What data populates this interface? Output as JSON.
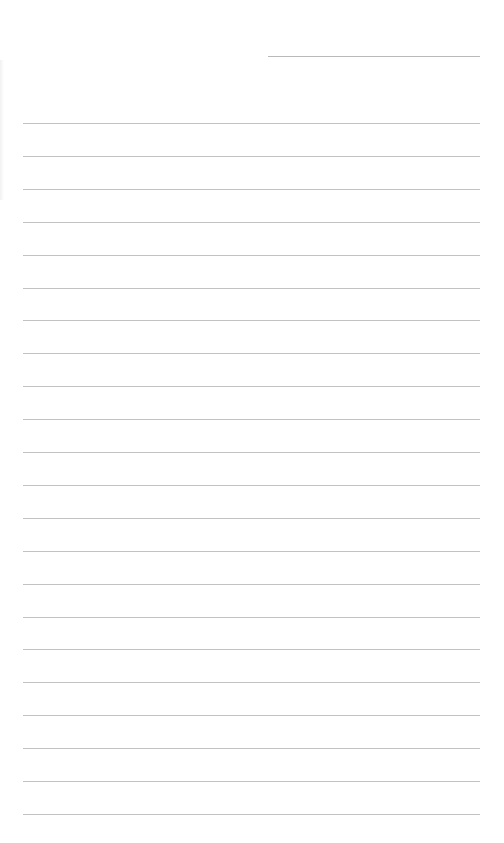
{
  "page": {
    "type": "blank lined notebook page",
    "background_color": "#ffffff",
    "line_color": "#c2c2c2",
    "header_line": {
      "present": true,
      "x": 268,
      "y": 56,
      "width": 212
    },
    "ruled_lines": {
      "count": 22,
      "first_y": 123,
      "spacing": 32.9,
      "left": 23,
      "right": 480
    }
  }
}
